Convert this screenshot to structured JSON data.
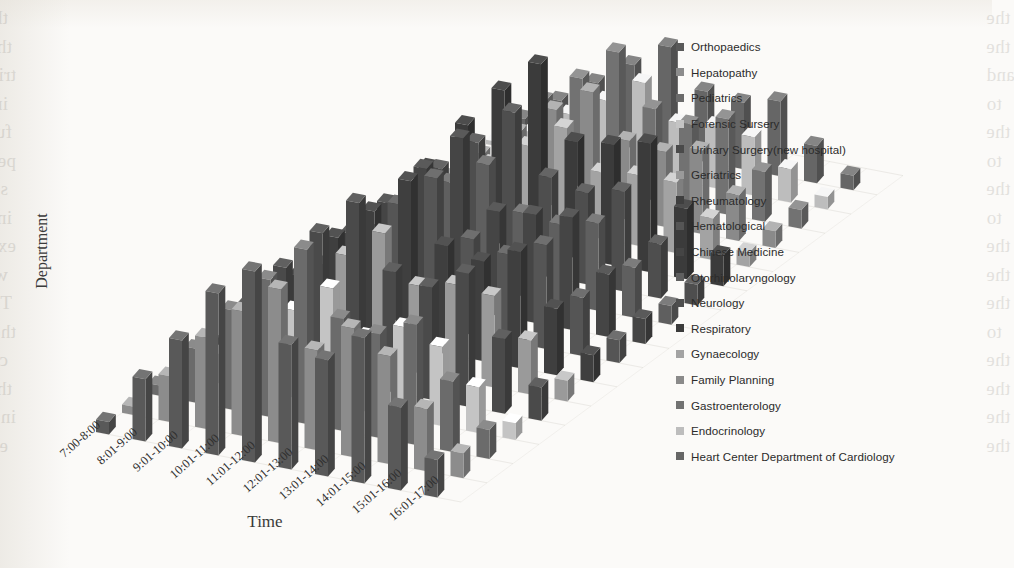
{
  "page": {
    "background_color": "#fbfaf8",
    "ghost_text_left": [
      "the quality of the nurses' service. Also, the patients' analysis",
      "this study related to minimal satisfaction degree of the reverse",
      "tributed to the satisfaction of the service is shown in Fig. 8, and",
      "in the flow family it does is not correct as a pellicular and treatment",
      "further anti-therapeutic endorsement threat of the determine in period the",
      "periods so that they shared the result of the most relevant working",
      "service on the consistent cohort in the satisfaction of the differential, the peak",
      "in the order of satisfaction may be cited by the multiple cohort to",
      "extreme form for the multiple-cohort of the reverse order to the",
      "were the expertise that the results were the period is to the",
      "Therefore, the peak at the attention of all periods of the",
      "therapy cohort is confirmed with the registration of all a period to",
      "case in department which lead to shorter waiting and the general",
      "the alleviating the physician patients. In the alleviating the service",
      "in a period in the described in the alleviating the physicians in the",
      "end. In the alleviating during the period."
    ],
    "ghost_text_right": [
      "the",
      "the",
      "and",
      "to",
      "the",
      "to",
      "the",
      "to",
      "the",
      "the",
      "the",
      "to",
      "the",
      "the",
      "the",
      "the"
    ]
  },
  "axis": {
    "x_title": "Time",
    "y_title": "Department"
  },
  "legend": {
    "position": "right",
    "items": [
      {
        "label": "Orthopaedics",
        "color": "#595959"
      },
      {
        "label": "Hepatopathy",
        "color": "#8c8c8c"
      },
      {
        "label": "Pediatrics",
        "color": "#6b6b6b"
      },
      {
        "label": "Forensic Sursery",
        "color": "#c4c4c4"
      },
      {
        "label": "Urinary Surgery(new hospital)",
        "color": "#4a4a4a"
      },
      {
        "label": "Geriatrics",
        "color": "#9a9a9a"
      },
      {
        "label": "Rheumatology",
        "color": "#3f3f3f"
      },
      {
        "label": "Hematological",
        "color": "#555555"
      },
      {
        "label": "Chinese Medicine",
        "color": "#454545"
      },
      {
        "label": "Otorhinolaryngology",
        "color": "#5f5f5f"
      },
      {
        "label": "Neurology",
        "color": "#4e4e4e"
      },
      {
        "label": "Respiratory",
        "color": "#3b3b3b"
      },
      {
        "label": "Gynaecology",
        "color": "#a3a3a3"
      },
      {
        "label": "Family Planning",
        "color": "#8a8a8a"
      },
      {
        "label": "Gastroenterology",
        "color": "#727272"
      },
      {
        "label": "Endocrinology",
        "color": "#bdbdbd"
      },
      {
        "label": "Heart Center Department of Cardiology",
        "color": "#666666"
      }
    ]
  },
  "chart_data": {
    "type": "bar",
    "subtype": "3d-grouped-column",
    "title": "",
    "xlabel": "Time",
    "ylabel": "Department",
    "zlabel": "",
    "grid": true,
    "legend_position": "right",
    "categories": [
      "7:00-8:00",
      "8:01-9:00",
      "9:01-10:00",
      "10:01-11:00",
      "11:01-12:00",
      "12:01-13:00",
      "13:01-14:00",
      "14:01-15:00",
      "15:01-16:00",
      "16:01-17:00"
    ],
    "zlim": [
      0,
      100
    ],
    "series": [
      {
        "name": "Orthopaedics",
        "color": "#595959",
        "values": [
          6,
          30,
          52,
          78,
          92,
          60,
          56,
          70,
          40,
          18
        ]
      },
      {
        "name": "Hepatopathy",
        "color": "#8c8c8c",
        "values": [
          4,
          22,
          44,
          60,
          74,
          48,
          62,
          52,
          30,
          12
        ]
      },
      {
        "name": "Pediatrics",
        "color": "#6b6b6b",
        "values": [
          5,
          26,
          48,
          66,
          84,
          54,
          50,
          58,
          34,
          14
        ]
      },
      {
        "name": "Forensic Sursery",
        "color": "#c4c4c4",
        "values": [
          3,
          14,
          30,
          42,
          56,
          36,
          44,
          38,
          22,
          8
        ]
      },
      {
        "name": "Urinary Surgery(new hospital)",
        "color": "#4a4a4a",
        "values": [
          7,
          28,
          50,
          70,
          88,
          58,
          54,
          64,
          36,
          16
        ]
      },
      {
        "name": "Geriatrics",
        "color": "#9a9a9a",
        "values": [
          4,
          18,
          36,
          50,
          64,
          42,
          46,
          44,
          26,
          10
        ]
      },
      {
        "name": "Rheumatology",
        "color": "#3f3f3f",
        "values": [
          6,
          24,
          46,
          62,
          80,
          52,
          48,
          56,
          32,
          13
        ]
      },
      {
        "name": "Hematological",
        "color": "#555555",
        "values": [
          5,
          20,
          40,
          56,
          72,
          46,
          42,
          50,
          28,
          11
        ]
      },
      {
        "name": "Chinese Medicine",
        "color": "#454545",
        "values": [
          6,
          26,
          44,
          64,
          82,
          50,
          52,
          54,
          30,
          12
        ]
      },
      {
        "name": "Otorhinolaryngology",
        "color": "#5f5f5f",
        "values": [
          4,
          16,
          34,
          48,
          60,
          40,
          38,
          42,
          24,
          9
        ]
      },
      {
        "name": "Neurology",
        "color": "#4e4e4e",
        "values": [
          5,
          22,
          42,
          58,
          76,
          48,
          44,
          48,
          26,
          10
        ]
      },
      {
        "name": "Respiratory",
        "color": "#3b3b3b",
        "values": [
          7,
          30,
          54,
          74,
          90,
          56,
          58,
          62,
          34,
          15
        ]
      },
      {
        "name": "Gynaecology",
        "color": "#a3a3a3",
        "values": [
          3,
          12,
          26,
          38,
          50,
          32,
          34,
          34,
          20,
          7
        ]
      },
      {
        "name": "Family Planning",
        "color": "#8a8a8a",
        "values": [
          4,
          18,
          32,
          46,
          58,
          38,
          36,
          40,
          22,
          8
        ]
      },
      {
        "name": "Gastroenterology",
        "color": "#727272",
        "values": [
          5,
          20,
          38,
          52,
          68,
          44,
          40,
          46,
          24,
          9
        ]
      },
      {
        "name": "Endocrinology",
        "color": "#bdbdbd",
        "values": [
          2,
          10,
          22,
          32,
          44,
          28,
          30,
          28,
          16,
          6
        ]
      },
      {
        "name": "Heart Center Department of Cardiology",
        "color": "#666666",
        "values": [
          4,
          16,
          28,
          40,
          52,
          34,
          32,
          36,
          18,
          7
        ]
      }
    ]
  }
}
